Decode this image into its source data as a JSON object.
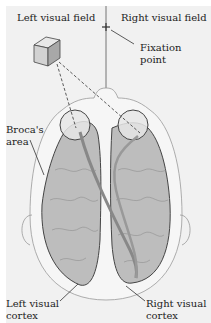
{
  "labels": {
    "left_visual_field": "Left visual field",
    "right_visual_field": "Right visual field",
    "fixation_point_1": "Fixation",
    "fixation_point_2": "point",
    "broca_1": "Broca's",
    "broca_2": "area",
    "left_cortex_1": "Left visual",
    "left_cortex_2": "cortex",
    "right_cortex_1": "Right visual",
    "right_cortex_2": "cortex"
  },
  "colors": {
    "background": "#f1f1f1",
    "brain": "#bdbdbd",
    "outline": "#444444",
    "eye": "#e6e6e6"
  }
}
